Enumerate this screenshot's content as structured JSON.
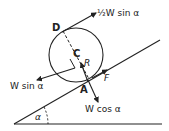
{
  "diagram": {
    "labels": {
      "point_d": "D",
      "point_c": "C",
      "point_a": "A",
      "reaction": "R",
      "friction": "F",
      "angle": "α",
      "force_top": "½W sin α",
      "force_down_slope": "W sin α",
      "force_normal_component": "W cos α"
    },
    "colors": {
      "ink": "#222222",
      "background": "#ffffff"
    }
  }
}
